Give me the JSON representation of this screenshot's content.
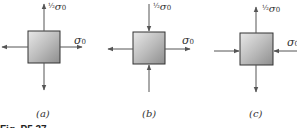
{
  "figure": {
    "panels": [
      {
        "id": "a",
        "caption": "(a)",
        "vertical_label": "½ σ₀",
        "vertical_label_coef": "1/2",
        "vertical_direction": "tension (outward)",
        "horizontal_label": "σ₀",
        "horizontal_direction": "tension (outward)"
      },
      {
        "id": "b",
        "caption": "(b)",
        "vertical_label": "½ σ₀",
        "vertical_label_coef": "1/2",
        "vertical_direction": "compression (inward)",
        "horizontal_label": "σ₀",
        "horizontal_direction": "tension (outward)"
      },
      {
        "id": "c",
        "caption": "(c)",
        "vertical_label": "½ σ₀",
        "vertical_label_coef": "1/2",
        "vertical_direction": "tension (outward)",
        "horizontal_label": "σ₀",
        "horizontal_direction": "compression (inward)"
      }
    ],
    "figure_label": "Fig. P5.37",
    "colors": {
      "arrow": "#555555",
      "element_fill_light": "#e6e6e6",
      "element_fill_dark": "#9a9a9a",
      "element_border": "#333333"
    }
  }
}
